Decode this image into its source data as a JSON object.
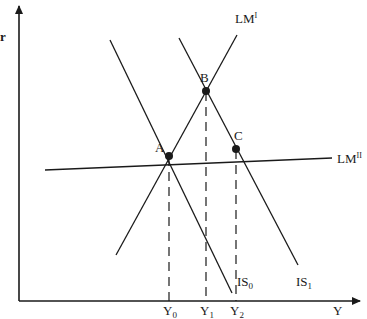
{
  "diagram": {
    "type": "IS-LM",
    "axes": {
      "y_axis_label": "r",
      "x_axis_label": "Y"
    },
    "curves": {
      "lm1": {
        "label": "LM",
        "sup": "I"
      },
      "lm11": {
        "label": "LM",
        "sup": "II"
      },
      "is0": {
        "label": "IS",
        "sub": "0"
      },
      "is1": {
        "label": "IS",
        "sub": "1"
      }
    },
    "points": {
      "a": "A",
      "b": "B",
      "c": "C"
    },
    "x_ticks": [
      {
        "label": "Y",
        "sub": "0"
      },
      {
        "label": "Y",
        "sub": "1"
      },
      {
        "label": "Y",
        "sub": "2"
      }
    ],
    "colors": {
      "line": "#1a1a1a",
      "background": "#ffffff"
    }
  }
}
